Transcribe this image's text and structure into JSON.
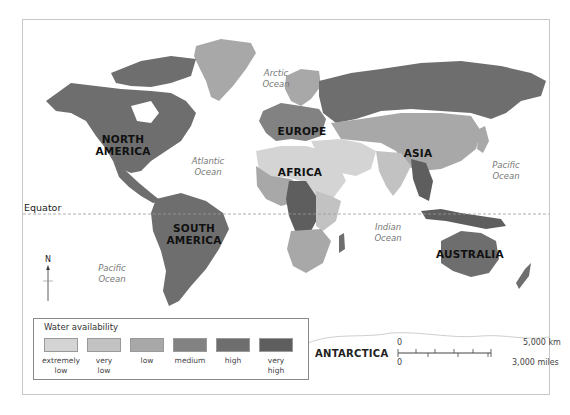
{
  "map": {
    "title": "Water availability world map",
    "continents": [
      {
        "id": "north-america",
        "label": "NORTH\nAMERICA"
      },
      {
        "id": "south-america",
        "label": "SOUTH\nAMERICA"
      },
      {
        "id": "europe",
        "label": "EUROPE"
      },
      {
        "id": "africa",
        "label": "AFRICA"
      },
      {
        "id": "asia",
        "label": "ASIA"
      },
      {
        "id": "australia",
        "label": "AUSTRALIA"
      },
      {
        "id": "antarctica",
        "label": "ANTARCTICA"
      }
    ],
    "continent_labels": {
      "north_america_1": "NORTH",
      "north_america_2": "AMERICA",
      "south_america_1": "SOUTH",
      "south_america_2": "AMERICA",
      "europe": "EUROPE",
      "africa": "AFRICA",
      "asia": "ASIA",
      "australia": "AUSTRALIA",
      "antarctica": "ANTARCTICA"
    },
    "ocean_labels": {
      "arctic_1": "Arctic",
      "arctic_2": "Ocean",
      "atlantic_1": "Atlantic",
      "atlantic_2": "Ocean",
      "pacific_east_1": "Pacific",
      "pacific_east_2": "Ocean",
      "pacific_west_1": "Pacific",
      "pacific_west_2": "Ocean",
      "indian_1": "Indian",
      "indian_2": "Ocean"
    },
    "equator_label": "Equator",
    "north_arrow_label": "N"
  },
  "legend": {
    "title": "Water availability",
    "items": [
      {
        "label_1": "extremely",
        "label_2": "low",
        "color": "#d4d4d4"
      },
      {
        "label_1": "very",
        "label_2": "low",
        "color": "#c2c2c2"
      },
      {
        "label_1": "low",
        "label_2": "",
        "color": "#a8a8a8"
      },
      {
        "label_1": "medium",
        "label_2": "",
        "color": "#828282"
      },
      {
        "label_1": "high",
        "label_2": "",
        "color": "#6e6e6e"
      },
      {
        "label_1": "very",
        "label_2": "high",
        "color": "#5e5e5e"
      }
    ]
  },
  "scale_bar": {
    "km_zero": "0",
    "km_label": "5,000 km",
    "mi_zero": "0",
    "mi_label": "3,000 miles"
  },
  "colors": {
    "extremely_low": "#d4d4d4",
    "very_low": "#c2c2c2",
    "low": "#a8a8a8",
    "medium": "#828282",
    "high": "#6e6e6e",
    "very_high": "#5e5e5e",
    "frame": "#c8c8c8",
    "equator": "#9a9a9a"
  }
}
